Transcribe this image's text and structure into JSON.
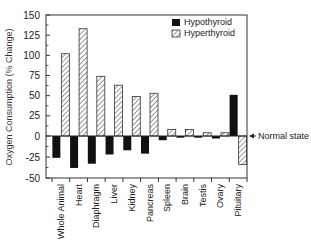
{
  "chart_data": {
    "type": "bar",
    "title": "",
    "xlabel": "",
    "ylabel": "Oxygen Consumption (% Change)",
    "ylim": [
      -50,
      150
    ],
    "yticks": [
      150,
      125,
      100,
      75,
      50,
      25,
      0,
      -25,
      -50
    ],
    "grid": false,
    "legend_position": "upper right (inside)",
    "categories": [
      "Whole Animal",
      "Heart",
      "Diaphragm",
      "Liver",
      "Kidney",
      "Pancreas",
      "Spleen",
      "Brain",
      "Testis",
      "Ovary",
      "Pituitary"
    ],
    "series": [
      {
        "name": "Hypothyroid",
        "style": "solid black",
        "values": [
          -26,
          -38,
          -33,
          -22,
          -17,
          -21,
          -5,
          -2,
          -2,
          -3,
          51
        ]
      },
      {
        "name": "Hyperthyroid",
        "style": "diagonal hatch",
        "values": [
          102,
          133,
          74,
          63,
          49,
          53,
          8,
          8,
          4,
          4,
          -34
        ]
      }
    ],
    "annotations": [
      {
        "text": "Normal state",
        "arrow_to": "y=0 line"
      }
    ]
  },
  "labels": {
    "ylabel": "Oxygen Consumption (% Change)",
    "legend_hypo": "Hypothyroid",
    "legend_hyper": "Hyperthyroid",
    "normal_state": "Normal state"
  }
}
